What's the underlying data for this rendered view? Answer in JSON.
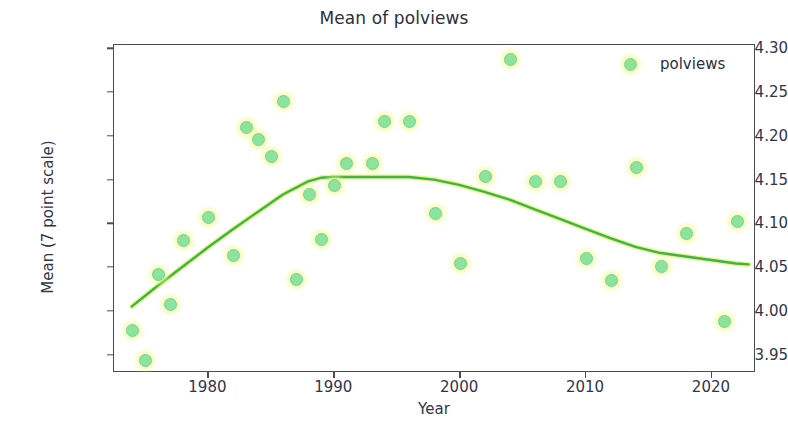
{
  "chart_data": {
    "type": "scatter",
    "title": "Mean of polviews",
    "xlabel": "Year",
    "ylabel": "Mean (7 point scale)",
    "xlim": [
      1972.5,
      2023.5
    ],
    "ylim": [
      3.93,
      4.305
    ],
    "grid": false,
    "legend_position": "upper right",
    "legend": [
      "polviews"
    ],
    "series": [
      {
        "name": "polviews",
        "marker_color": "#8ce39b",
        "x": [
          1974,
          1975,
          1976,
          1977,
          1978,
          1980,
          1982,
          1983,
          1984,
          1985,
          1986,
          1987,
          1988,
          1989,
          1990,
          1991,
          1993,
          1994,
          1996,
          1998,
          2000,
          2002,
          2004,
          2006,
          2008,
          2010,
          2012,
          2014,
          2016,
          2018,
          2021,
          2022
        ],
        "y": [
          3.979,
          3.944,
          4.043,
          4.008,
          4.081,
          4.108,
          4.064,
          4.211,
          4.197,
          4.177,
          4.24,
          4.037,
          4.134,
          4.083,
          4.144,
          4.17,
          4.17,
          4.217,
          4.217,
          4.112,
          4.055,
          4.155,
          4.288,
          4.149,
          4.149,
          4.061,
          4.036,
          4.165,
          4.052,
          4.09,
          3.989,
          4.103
        ]
      }
    ],
    "trend": {
      "name": "lowess-trend",
      "color": "#3cb44a",
      "x": [
        1974,
        1976,
        1978,
        1980,
        1982,
        1984,
        1986,
        1988,
        1989,
        1990,
        1991,
        1992,
        1994,
        1996,
        1998,
        2000,
        2002,
        2004,
        2006,
        2008,
        2010,
        2012,
        2014,
        2016,
        2018,
        2020,
        2022,
        2023
      ],
      "y": [
        4.005,
        4.028,
        4.05,
        4.072,
        4.093,
        4.113,
        4.133,
        4.148,
        4.152,
        4.153,
        4.153,
        4.153,
        4.153,
        4.153,
        4.15,
        4.144,
        4.136,
        4.127,
        4.116,
        4.105,
        4.094,
        4.083,
        4.073,
        4.066,
        4.062,
        4.058,
        4.054,
        4.053
      ]
    },
    "yticks": [
      3.95,
      4.0,
      4.05,
      4.1,
      4.15,
      4.2,
      4.25,
      4.3
    ],
    "ytick_labels": [
      "3.95",
      "4.00",
      "4.05",
      "4.10",
      "4.15",
      "4.20",
      "4.25",
      "4.30"
    ],
    "xticks": [
      1980,
      1990,
      2000,
      2010,
      2020
    ],
    "xtick_labels": [
      "1980",
      "1990",
      "2000",
      "2010",
      "2020"
    ]
  }
}
